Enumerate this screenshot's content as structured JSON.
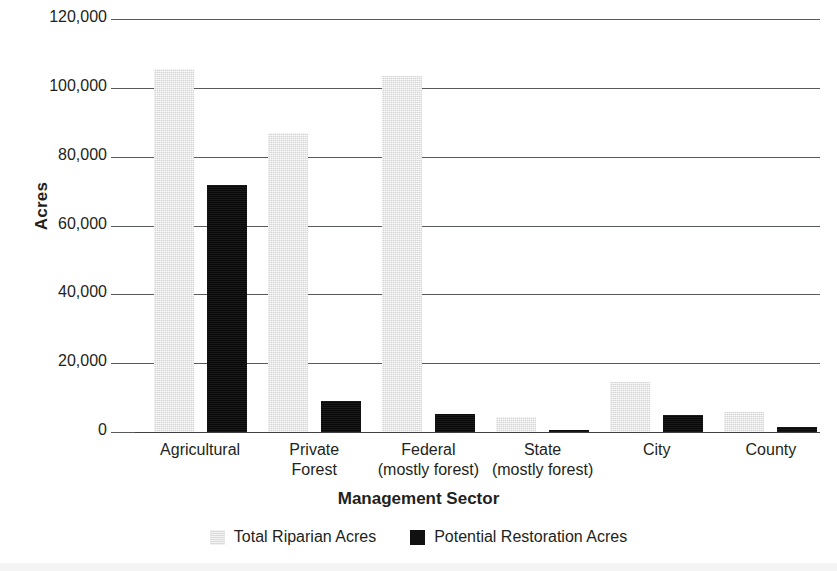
{
  "chart_data": {
    "type": "bar",
    "title": "",
    "xlabel": "Management Sector",
    "ylabel": "Acres",
    "ylim": [
      0,
      120000
    ],
    "yticks": [
      0,
      20000,
      40000,
      60000,
      80000,
      100000,
      120000
    ],
    "ytick_labels": [
      "0",
      "20,000",
      "40,000",
      "60,000",
      "80,000",
      "100,000",
      "120,000"
    ],
    "grid": true,
    "legend_position": "bottom",
    "categories": [
      {
        "line1": "Agricultural",
        "line2": ""
      },
      {
        "line1": "Private",
        "line2": "Forest"
      },
      {
        "line1": "Federal",
        "line2": "(mostly forest)"
      },
      {
        "line1": "State",
        "line2": "(mostly forest)"
      },
      {
        "line1": "City",
        "line2": ""
      },
      {
        "line1": "County",
        "line2": ""
      }
    ],
    "series": [
      {
        "name": "Total Riparian Acres",
        "color": "#e3e3e3",
        "values": [
          105500,
          86800,
          103400,
          4500,
          14600,
          5700
        ]
      },
      {
        "name": "Potential Restoration Acres",
        "color": "#111111",
        "values": [
          71800,
          8900,
          5100,
          500,
          4900,
          1600
        ]
      }
    ]
  },
  "legend": {
    "items": [
      {
        "label": "Total Riparian Acres",
        "swatch": "light-gray-square"
      },
      {
        "label": "Potential Restoration Acres",
        "swatch": "black-square"
      }
    ]
  }
}
